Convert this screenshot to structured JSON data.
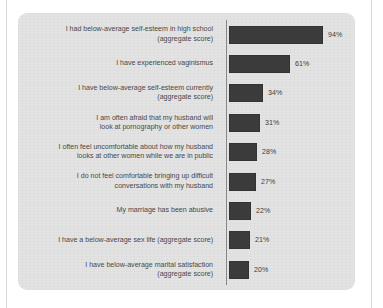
{
  "chart_data": {
    "type": "bar",
    "orientation": "horizontal",
    "title": "",
    "subtitle": "",
    "xlabel": "",
    "ylabel": "",
    "grid": false,
    "legend": null,
    "xlim": [
      0,
      100
    ],
    "value_suffix": "%",
    "axis_line": true,
    "categories": [
      "I had below-average self-esteem in high school\n(aggregate score)",
      "I have experienced vaginismus",
      "I have below-average self-esteem currently\n(aggregate score)",
      "I am often afraid that my husband will\nlook at pornography or other women",
      "I often feel uncomfortable about how my husband\nlooks at other women while we are in public",
      "I do not feel comfortable bringing up difficult\nconversations with my husband",
      "My marriage has been abusive",
      "I have a below-average sex life (aggregate score)",
      "I have below-average marital satisfaction\n(aggregate score)"
    ],
    "values": [
      94,
      61,
      34,
      31,
      28,
      27,
      22,
      21,
      20
    ],
    "value_labels": [
      "94%",
      "61%",
      "34%",
      "31%",
      "28%",
      "27%",
      "22%",
      "21%",
      "20%"
    ],
    "colors": {
      "bar": "#3c3c3c",
      "panel_background": "#e3e3e3",
      "page_background": "#ffffff",
      "label_text": "#4a4a4a",
      "axis_line": "#8a8a8a",
      "frame_rule": "#d9d9d9"
    }
  }
}
